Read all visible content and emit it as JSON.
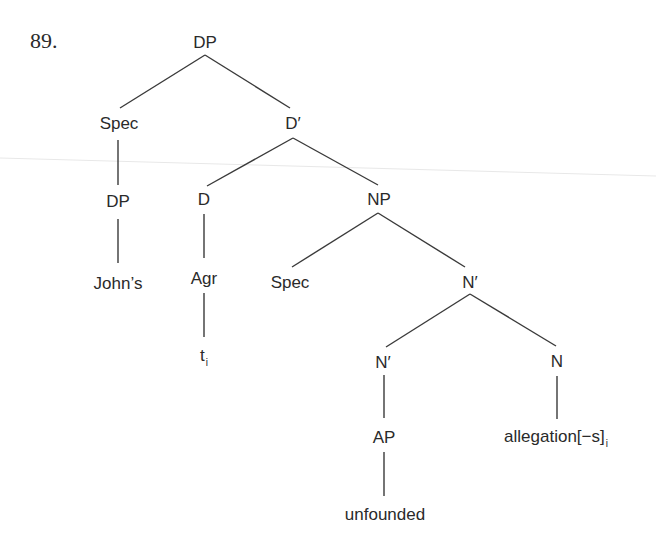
{
  "example": {
    "number": "89."
  },
  "tree": {
    "nodes": {
      "dp_root": {
        "label": "DP",
        "x": 205,
        "y": 42
      },
      "spec_top": {
        "label": "Spec",
        "x": 119,
        "y": 123
      },
      "d_bar": {
        "label": "D′",
        "x": 293,
        "y": 123
      },
      "dp_left": {
        "label": "DP",
        "x": 118,
        "y": 201
      },
      "johns": {
        "label": "John’s",
        "x": 118,
        "y": 283
      },
      "d_head": {
        "label": "D",
        "x": 204,
        "y": 199
      },
      "agr": {
        "label": "Agr",
        "x": 204,
        "y": 278
      },
      "trace": {
        "label": "t",
        "subscript": "i",
        "x": 204,
        "y": 355
      },
      "np": {
        "label": "NP",
        "x": 379,
        "y": 199
      },
      "spec_np": {
        "label": "Spec",
        "x": 290,
        "y": 282
      },
      "n_bar_top": {
        "label": "N′",
        "x": 470,
        "y": 282
      },
      "n_bar_low": {
        "label": "N′",
        "x": 383,
        "y": 362
      },
      "n_head": {
        "label": "N",
        "x": 557,
        "y": 361
      },
      "ap": {
        "label": "AP",
        "x": 384,
        "y": 437
      },
      "unfounded": {
        "label": "unfounded",
        "x": 385,
        "y": 514
      },
      "allegation": {
        "label": "allegation[−s]",
        "subscript": "i",
        "x": 556,
        "y": 436
      }
    },
    "edges": [
      {
        "from": "dp_root",
        "to": "spec_top",
        "x1": 205,
        "y1": 55,
        "x2": 120,
        "y2": 108
      },
      {
        "from": "dp_root",
        "to": "d_bar",
        "x1": 205,
        "y1": 55,
        "x2": 290,
        "y2": 108
      },
      {
        "from": "spec_top",
        "to": "dp_left",
        "x1": 118,
        "y1": 140,
        "x2": 118,
        "y2": 185
      },
      {
        "from": "dp_left",
        "to": "johns",
        "x1": 118,
        "y1": 219,
        "x2": 118,
        "y2": 263
      },
      {
        "from": "d_bar",
        "to": "d_head",
        "x1": 293,
        "y1": 138,
        "x2": 207,
        "y2": 186
      },
      {
        "from": "d_bar",
        "to": "np",
        "x1": 293,
        "y1": 138,
        "x2": 378,
        "y2": 185
      },
      {
        "from": "d_head",
        "to": "agr",
        "x1": 204,
        "y1": 214,
        "x2": 204,
        "y2": 258
      },
      {
        "from": "agr",
        "to": "trace",
        "x1": 204,
        "y1": 293,
        "x2": 204,
        "y2": 337
      },
      {
        "from": "np",
        "to": "spec_np",
        "x1": 378,
        "y1": 213,
        "x2": 292,
        "y2": 267
      },
      {
        "from": "np",
        "to": "n_bar_top",
        "x1": 378,
        "y1": 213,
        "x2": 465,
        "y2": 267
      },
      {
        "from": "n_bar_top",
        "to": "n_bar_low",
        "x1": 470,
        "y1": 294,
        "x2": 386,
        "y2": 347
      },
      {
        "from": "n_bar_top",
        "to": "n_head",
        "x1": 470,
        "y1": 294,
        "x2": 556,
        "y2": 346
      },
      {
        "from": "n_bar_low",
        "to": "ap",
        "x1": 384,
        "y1": 375,
        "x2": 384,
        "y2": 418
      },
      {
        "from": "ap",
        "to": "unfounded",
        "x1": 384,
        "y1": 452,
        "x2": 384,
        "y2": 496
      },
      {
        "from": "n_head",
        "to": "allegation",
        "x1": 557,
        "y1": 376,
        "x2": 557,
        "y2": 419
      }
    ]
  }
}
